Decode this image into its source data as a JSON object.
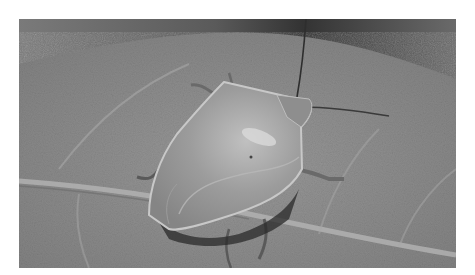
{
  "image": {
    "subject": "Green stink bug on a leaf",
    "description": "Grayscale photograph of a shield-shaped stink bug resting on a large textured leaf, with antennae extended and a darker background at top",
    "colors": {
      "border": "#ffffff",
      "leaf": "#8c8c8c",
      "leaf_light": "#a0a0a0",
      "leaf_vein": "#b2b2b2",
      "background_dark": "#3e3e3e",
      "background_top": "#6e6e6e",
      "bug_body": "#9a9a9a",
      "bug_highlight": "#d4d4d4",
      "bug_edge": "#c8c8c8",
      "shadow": "#2a2a2a"
    }
  }
}
